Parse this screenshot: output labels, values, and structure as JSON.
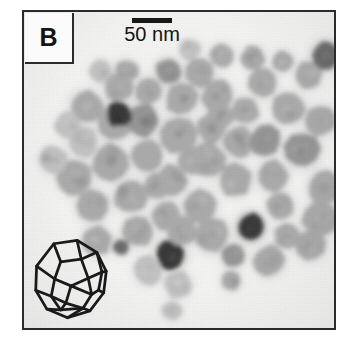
{
  "figure": {
    "panel_label": "B",
    "scale_bar": {
      "label": "50 nm",
      "bar_length_px": 40,
      "represents_nm": 50
    },
    "inset": {
      "name": "truncated-octahedron-wireframe",
      "description": "line drawing of a faceted truncated-octahedron nanocrystal"
    },
    "micrograph": {
      "modality": "TEM",
      "background_color": "#f6f6f5",
      "frame_color": "#2b2b2b",
      "particle_shades": {
        "light": "#bdbdbd",
        "mid": "#a2a2a2",
        "dark_mid": "#8a8a8a",
        "dark": "#5a5a5a",
        "very_dark": "#343434"
      }
    }
  },
  "chart_data": {
    "type": "scatter",
    "title": "",
    "xlabel": "",
    "ylabel": "",
    "note": "TEM micrograph of faceted nanoparticles; each datum is one particle centre (x,y in frame pixels), r = apparent radius in px, s = grey shade index 0=lightest .. 4=darkest",
    "shade_palette": [
      "#c2c2c2",
      "#aaaaaa",
      "#949494",
      "#6a6a6a",
      "#363636"
    ],
    "particles": [
      {
        "x": 63,
        "y": 96,
        "r": 17,
        "s": 1
      },
      {
        "x": 96,
        "y": 76,
        "r": 15,
        "s": 1
      },
      {
        "x": 92,
        "y": 112,
        "r": 18,
        "s": 1
      },
      {
        "x": 60,
        "y": 132,
        "r": 16,
        "s": 0
      },
      {
        "x": 88,
        "y": 152,
        "r": 19,
        "s": 1
      },
      {
        "x": 52,
        "y": 168,
        "r": 18,
        "s": 1
      },
      {
        "x": 30,
        "y": 150,
        "r": 15,
        "s": 0
      },
      {
        "x": 70,
        "y": 196,
        "r": 17,
        "s": 1
      },
      {
        "x": 108,
        "y": 186,
        "r": 17,
        "s": 1
      },
      {
        "x": 124,
        "y": 146,
        "r": 16,
        "s": 1
      },
      {
        "x": 120,
        "y": 110,
        "r": 17,
        "s": 2
      },
      {
        "x": 126,
        "y": 80,
        "r": 14,
        "s": 1
      },
      {
        "x": 146,
        "y": 60,
        "r": 13,
        "s": 2
      },
      {
        "x": 160,
        "y": 88,
        "r": 17,
        "s": 1
      },
      {
        "x": 178,
        "y": 62,
        "r": 15,
        "s": 1
      },
      {
        "x": 196,
        "y": 84,
        "r": 16,
        "s": 1
      },
      {
        "x": 156,
        "y": 124,
        "r": 19,
        "s": 1
      },
      {
        "x": 190,
        "y": 118,
        "r": 15,
        "s": 1
      },
      {
        "x": 186,
        "y": 150,
        "r": 18,
        "s": 1
      },
      {
        "x": 150,
        "y": 170,
        "r": 16,
        "s": 1
      },
      {
        "x": 116,
        "y": 222,
        "r": 16,
        "s": 1
      },
      {
        "x": 144,
        "y": 206,
        "r": 15,
        "s": 1
      },
      {
        "x": 178,
        "y": 196,
        "r": 17,
        "s": 1
      },
      {
        "x": 214,
        "y": 170,
        "r": 17,
        "s": 1
      },
      {
        "x": 218,
        "y": 132,
        "r": 16,
        "s": 1
      },
      {
        "x": 224,
        "y": 100,
        "r": 14,
        "s": 1
      },
      {
        "x": 242,
        "y": 72,
        "r": 15,
        "s": 1
      },
      {
        "x": 244,
        "y": 130,
        "r": 16,
        "s": 2
      },
      {
        "x": 252,
        "y": 166,
        "r": 16,
        "s": 1
      },
      {
        "x": 268,
        "y": 98,
        "r": 17,
        "s": 1
      },
      {
        "x": 282,
        "y": 140,
        "r": 18,
        "s": 2
      },
      {
        "x": 288,
        "y": 64,
        "r": 14,
        "s": 1
      },
      {
        "x": 300,
        "y": 110,
        "r": 16,
        "s": 1
      },
      {
        "x": 304,
        "y": 178,
        "r": 17,
        "s": 1
      },
      {
        "x": 300,
        "y": 210,
        "r": 18,
        "s": 1
      },
      {
        "x": 290,
        "y": 236,
        "r": 16,
        "s": 1
      },
      {
        "x": 306,
        "y": 44,
        "r": 14,
        "s": 3
      },
      {
        "x": 96,
        "y": 104,
        "r": 13,
        "s": 4
      },
      {
        "x": 148,
        "y": 246,
        "r": 15,
        "s": 4
      },
      {
        "x": 230,
        "y": 218,
        "r": 14,
        "s": 4
      },
      {
        "x": 98,
        "y": 238,
        "r": 8,
        "s": 3
      },
      {
        "x": 212,
        "y": 246,
        "r": 12,
        "s": 2
      },
      {
        "x": 210,
        "y": 272,
        "r": 10,
        "s": 1
      },
      {
        "x": 248,
        "y": 252,
        "r": 16,
        "s": 1
      },
      {
        "x": 190,
        "y": 226,
        "r": 18,
        "s": 1
      },
      {
        "x": 160,
        "y": 222,
        "r": 15,
        "s": 1
      },
      {
        "x": 126,
        "y": 262,
        "r": 15,
        "s": 0
      },
      {
        "x": 156,
        "y": 276,
        "r": 14,
        "s": 0
      },
      {
        "x": 150,
        "y": 302,
        "r": 10,
        "s": 0
      },
      {
        "x": 74,
        "y": 232,
        "r": 15,
        "s": 1
      },
      {
        "x": 198,
        "y": 106,
        "r": 14,
        "s": 1
      },
      {
        "x": 170,
        "y": 150,
        "r": 14,
        "s": 1
      },
      {
        "x": 134,
        "y": 176,
        "r": 14,
        "s": 1
      },
      {
        "x": 104,
        "y": 60,
        "r": 12,
        "s": 1
      },
      {
        "x": 260,
        "y": 196,
        "r": 14,
        "s": 1
      },
      {
        "x": 266,
        "y": 226,
        "r": 13,
        "s": 1
      },
      {
        "x": 44,
        "y": 114,
        "r": 13,
        "s": 0
      },
      {
        "x": 78,
        "y": 60,
        "r": 12,
        "s": 0
      },
      {
        "x": 232,
        "y": 46,
        "r": 12,
        "s": 1
      },
      {
        "x": 200,
        "y": 44,
        "r": 12,
        "s": 1
      },
      {
        "x": 168,
        "y": 38,
        "r": 11,
        "s": 0
      },
      {
        "x": 262,
        "y": 50,
        "r": 11,
        "s": 1
      }
    ]
  }
}
